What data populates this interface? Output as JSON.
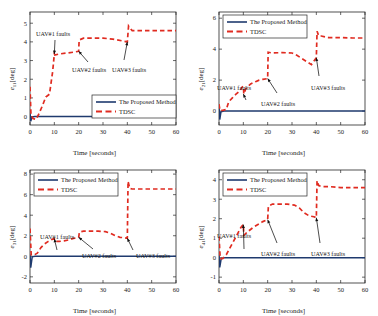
{
  "figure": {
    "background": "#ffffff",
    "panel_count": 4
  },
  "style": {
    "proposed_color": "#1f3a6e",
    "tdsc_color": "#e02b20",
    "axis_color": "#262626",
    "text_color": "#1a1a1a"
  },
  "legend": {
    "proposed_label": "The Proposed Method",
    "tdsc_label": "TDSC"
  },
  "annotations": {
    "uav1": "UAV#1 faults",
    "uav2": "UAV#2 faults",
    "uav3": "UAV#3 faults"
  },
  "axes": {
    "xlabel": "Time [seconds]",
    "xticks": [
      "0",
      "10",
      "20",
      "30",
      "40",
      "50",
      "60"
    ]
  },
  "panels": {
    "p1": {
      "ylabel_base": "e",
      "ylabel_sub": "11",
      "ylabel_unit": "[deg]",
      "yticks": [
        "0",
        "1",
        "2",
        "3",
        "4",
        "5"
      ]
    },
    "p2": {
      "ylabel_base": "e",
      "ylabel_sub": "21",
      "ylabel_unit": "[deg]",
      "yticks": [
        "0",
        "2",
        "4",
        "6"
      ]
    },
    "p3": {
      "ylabel_base": "e",
      "ylabel_sub": "31",
      "ylabel_unit": "[deg]",
      "yticks": [
        "-2",
        "0",
        "2",
        "4",
        "6",
        "8"
      ]
    },
    "p4": {
      "ylabel_base": "e",
      "ylabel_sub": "41",
      "ylabel_unit": "[deg]",
      "yticks": [
        "-1",
        "0",
        "1",
        "2",
        "3",
        "4"
      ]
    }
  },
  "chart_data": [
    {
      "id": "p1",
      "type": "line",
      "title": "",
      "xlabel": "Time [seconds]",
      "ylabel": "e_11 [deg]",
      "xlim": [
        0,
        60
      ],
      "ylim": [
        -0.45,
        5.6
      ],
      "xticks": [
        0,
        10,
        20,
        30,
        40,
        50,
        60
      ],
      "yticks": [
        0,
        1,
        2,
        3,
        4,
        5
      ],
      "grid": false,
      "legend_position": "lower-right",
      "annotations": [
        {
          "text": "UAV#1 faults",
          "points_to_x": 10,
          "points_to_y": 3.35
        },
        {
          "text": "UAV#2 faults",
          "points_to_x": 20,
          "points_to_y": 3.5
        },
        {
          "text": "UAV#3 faults",
          "points_to_x": 40,
          "points_to_y": 4.0
        }
      ],
      "series": [
        {
          "name": "The Proposed Method",
          "style": "solid",
          "color": "#1f3a6e",
          "x": [
            0,
            0.3,
            0.8,
            2,
            60
          ],
          "y": [
            0.2,
            -0.25,
            -0.02,
            0.0,
            0.0
          ]
        },
        {
          "name": "TDSC",
          "style": "dashed",
          "color": "#e02b20",
          "x": [
            0,
            0.4,
            1.2,
            2.5,
            3.5,
            5,
            6.5,
            8,
            9.3,
            10,
            10.2,
            12,
            15,
            18,
            20,
            20.2,
            22,
            26,
            30,
            34,
            38,
            40,
            40.5,
            41,
            42,
            45,
            50,
            55,
            60
          ],
          "y": [
            1.6,
            0.1,
            -0.1,
            -0.15,
            0.1,
            0.55,
            1.05,
            1.2,
            2.4,
            3.35,
            3.3,
            3.35,
            3.4,
            3.45,
            3.5,
            4.1,
            4.2,
            4.2,
            4.2,
            4.15,
            4.05,
            4.0,
            4.85,
            4.75,
            4.6,
            4.6,
            4.6,
            4.6,
            4.6
          ]
        }
      ]
    },
    {
      "id": "p2",
      "type": "line",
      "title": "",
      "xlabel": "Time [seconds]",
      "ylabel": "e_21 [deg]",
      "xlim": [
        0,
        60
      ],
      "ylim": [
        -0.9,
        6.4
      ],
      "xticks": [
        0,
        10,
        20,
        30,
        40,
        50,
        60
      ],
      "yticks": [
        0,
        2,
        4,
        6
      ],
      "grid": false,
      "legend_position": "upper-left",
      "annotations": [
        {
          "text": "UAV#1 faults",
          "points_to_x": 10,
          "points_to_y": 1.1
        },
        {
          "text": "UAV#2 faults",
          "points_to_x": 20,
          "points_to_y": 2.1
        },
        {
          "text": "UAV#3 faults",
          "points_to_x": 40,
          "points_to_y": 3.45
        }
      ],
      "series": [
        {
          "name": "The Proposed Method",
          "style": "solid",
          "color": "#1f3a6e",
          "x": [
            0,
            0.3,
            0.8,
            2,
            60
          ],
          "y": [
            0.35,
            -0.55,
            -0.05,
            0.0,
            0.0
          ]
        },
        {
          "name": "TDSC",
          "style": "dashed",
          "color": "#e02b20",
          "x": [
            0,
            0.4,
            1.5,
            3,
            4,
            5.5,
            7,
            8.5,
            9.5,
            10,
            10.2,
            11,
            13,
            15,
            16.5,
            18,
            20,
            20.2,
            22,
            26,
            30,
            32,
            34,
            36,
            38,
            40,
            40.3,
            41,
            42,
            45,
            50,
            55,
            60
          ],
          "y": [
            0.45,
            0.05,
            0.05,
            0.1,
            0.6,
            0.85,
            1.1,
            1.3,
            1.55,
            1.6,
            1.1,
            1.45,
            1.75,
            1.9,
            2.0,
            2.05,
            2.1,
            3.8,
            3.75,
            3.78,
            3.75,
            3.6,
            3.4,
            3.2,
            3.0,
            3.45,
            5.15,
            4.85,
            4.85,
            4.75,
            4.75,
            4.72,
            4.72
          ]
        }
      ]
    },
    {
      "id": "p3",
      "type": "line",
      "title": "",
      "xlabel": "Time [seconds]",
      "ylabel": "e_31 [deg]",
      "xlim": [
        0,
        60
      ],
      "ylim": [
        -2.6,
        8.4
      ],
      "xticks": [
        0,
        10,
        20,
        30,
        40,
        50,
        60
      ],
      "yticks": [
        -2,
        0,
        2,
        4,
        6,
        8
      ],
      "grid": false,
      "legend_position": "upper-left",
      "annotations": [
        {
          "text": "UAV#1 faults",
          "points_to_x": 10,
          "points_to_y": 1.7
        },
        {
          "text": "UAV#2 faults",
          "points_to_x": 20,
          "points_to_y": 1.85
        },
        {
          "text": "UAV#3 faults",
          "points_to_x": 40,
          "points_to_y": 1.75
        }
      ],
      "series": [
        {
          "name": "The Proposed Method",
          "style": "solid",
          "color": "#1f3a6e",
          "x": [
            0,
            0.3,
            0.9,
            2,
            60
          ],
          "y": [
            0.2,
            -1.1,
            -0.05,
            0.0,
            0.0
          ]
        },
        {
          "name": "TDSC",
          "style": "dashed",
          "color": "#e02b20",
          "x": [
            0,
            0.5,
            1.5,
            3,
            4.5,
            6,
            7.5,
            9,
            10,
            10.2,
            12,
            14,
            16,
            18,
            20,
            20.3,
            22,
            25,
            28,
            31,
            33,
            35,
            37,
            39,
            40,
            40.3,
            41,
            42,
            45,
            50,
            55,
            60
          ],
          "y": [
            2.7,
            0.15,
            0.1,
            0.3,
            0.85,
            1.2,
            1.45,
            1.65,
            1.7,
            1.45,
            1.45,
            1.5,
            1.6,
            1.75,
            1.85,
            2.35,
            2.45,
            2.45,
            2.45,
            2.4,
            2.25,
            2.0,
            1.85,
            1.8,
            1.75,
            7.3,
            6.6,
            6.55,
            6.55,
            6.55,
            6.55,
            6.55
          ]
        }
      ]
    },
    {
      "id": "p4",
      "type": "line",
      "title": "",
      "xlabel": "Time [seconds]",
      "ylabel": "e_41 [deg]",
      "xlim": [
        0,
        60
      ],
      "ylim": [
        -1.3,
        4.5
      ],
      "xticks": [
        0,
        10,
        20,
        30,
        40,
        50,
        60
      ],
      "yticks": [
        -1,
        0,
        1,
        2,
        3,
        4
      ],
      "grid": false,
      "legend_position": "upper-left",
      "annotations": [
        {
          "text": "UAV#1 faults",
          "points_to_x": 10,
          "points_to_y": 1.7
        },
        {
          "text": "UAV#2 faults",
          "points_to_x": 20,
          "points_to_y": 1.95
        },
        {
          "text": "UAV#3 faults",
          "points_to_x": 40,
          "points_to_y": 2.05
        }
      ],
      "series": [
        {
          "name": "The Proposed Method",
          "style": "solid",
          "color": "#1f3a6e",
          "x": [
            0,
            0.3,
            0.9,
            2,
            60
          ],
          "y": [
            0.15,
            -0.5,
            -0.05,
            0.0,
            0.0
          ]
        },
        {
          "name": "TDSC",
          "style": "dashed",
          "color": "#e02b20",
          "x": [
            0,
            0.5,
            1.5,
            3,
            4.5,
            6,
            7.5,
            9,
            10,
            10.2,
            12,
            14,
            16,
            18,
            20,
            20.3,
            22,
            25,
            28,
            31,
            33,
            35,
            37,
            39,
            40,
            40.3,
            41,
            42,
            45,
            50,
            55,
            60
          ],
          "y": [
            1.1,
            -0.05,
            -0.05,
            0.15,
            0.5,
            0.85,
            1.2,
            1.55,
            1.7,
            1.15,
            1.35,
            1.55,
            1.7,
            1.85,
            1.95,
            2.65,
            2.75,
            2.75,
            2.75,
            2.7,
            2.55,
            2.3,
            2.15,
            2.1,
            2.05,
            3.95,
            3.7,
            3.65,
            3.65,
            3.6,
            3.6,
            3.6
          ]
        }
      ]
    }
  ]
}
